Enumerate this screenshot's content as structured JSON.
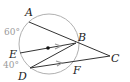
{
  "diagram": {
    "type": "geometry",
    "circle": {
      "cx": 49,
      "cy": 44,
      "r": 30,
      "stroke": "#b0b0b0"
    },
    "points": {
      "A": {
        "label": "A",
        "x": 29,
        "y": 22
      },
      "B": {
        "label": "B",
        "x": 76,
        "y": 43
      },
      "C": {
        "label": "C",
        "x": 110,
        "y": 56
      },
      "D": {
        "label": "D",
        "x": 30,
        "y": 68
      },
      "E": {
        "label": "E",
        "x": 20,
        "y": 53
      },
      "F": {
        "label": "F",
        "x": 75,
        "y": 62
      }
    },
    "segments": [
      "A-C",
      "E-B",
      "D-B",
      "D-C"
    ],
    "parallel_marks": [
      "E-B",
      "D-F"
    ],
    "center_dot": {
      "x": 48,
      "y": 48
    },
    "arc_labels": {
      "arc_AE": "60°",
      "arc_ED": "40°"
    },
    "colors": {
      "line": "#333333",
      "circle": "#b0b0b0",
      "arrow": "#999999",
      "arc_label": "#9a9a9a"
    }
  }
}
